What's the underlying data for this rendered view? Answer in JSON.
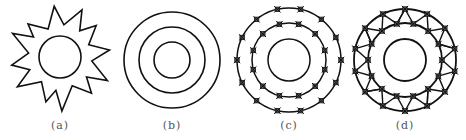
{
  "figure": {
    "panels": [
      {
        "id": "a",
        "label": "(a)",
        "type": "star-with-circle",
        "center": [
          60,
          57
        ],
        "inner_circle_radius": 21,
        "star_points": 12,
        "star_outer_radius": 50,
        "star_inner_radius": 32,
        "star_rotation_deg": -8,
        "jitter": [
          0,
          3,
          -2,
          4,
          -3,
          2,
          -1,
          3,
          -4,
          1,
          2,
          -2
        ],
        "label_x": 60
      },
      {
        "id": "b",
        "label": "(b)",
        "type": "concentric-circles",
        "center": [
          172,
          60
        ],
        "radii": [
          48,
          33,
          18
        ],
        "label_x": 172
      },
      {
        "id": "c",
        "label": "(c)",
        "type": "concentric-circles-with-nodes",
        "center": [
          289,
          60
        ],
        "radii": [
          52,
          37,
          21
        ],
        "outer_nodes": 14,
        "inner_nodes": 12,
        "outer_offset_deg": 0,
        "inner_offset_deg": 15,
        "label_x": 289
      },
      {
        "id": "d",
        "label": "(d)",
        "type": "meshed-ring",
        "center": [
          405,
          60
        ],
        "radii": [
          51,
          37,
          21
        ],
        "outer_nodes": 14,
        "inner_nodes": 14,
        "outer_offset_deg": -90,
        "inner_offset_deg": -77,
        "label_x": 405
      }
    ],
    "stroke_color": "#111111",
    "label_color": "#555555"
  }
}
